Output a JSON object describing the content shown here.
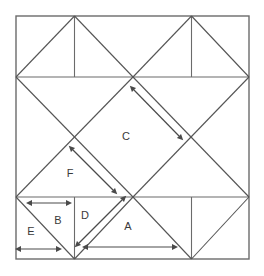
{
  "figure": {
    "type": "geometric-diagram",
    "background_color": "#ffffff",
    "line_color": "#6b6b6b",
    "diagonal_color": "#555555",
    "arrow_color": "#4a4a4a",
    "label_color": "#3a3a3a",
    "canvas": {
      "width": 264,
      "height": 276
    }
  },
  "outer_square": {
    "name": "outer-square",
    "left": 16,
    "top": 16,
    "right": 249,
    "bottom": 259,
    "width": 233,
    "height": 243
  },
  "grid": {
    "x_stops": [
      16,
      74.5,
      133,
      191.5,
      249
    ],
    "y_stops": [
      16,
      77,
      197,
      259
    ],
    "horizontal_lines": [
      {
        "name": "upper-horizontal",
        "y": 77,
        "x1": 16,
        "x2": 249
      },
      {
        "name": "lower-horizontal",
        "y": 197,
        "x1": 16,
        "x2": 249
      }
    ],
    "vertical_lines": [
      {
        "name": "top-band-vertical-left",
        "x": 74.5,
        "y1": 16,
        "y2": 77
      },
      {
        "name": "top-band-vertical-right",
        "x": 191.5,
        "y1": 16,
        "y2": 77
      },
      {
        "name": "bottom-band-vertical-left",
        "x": 74.5,
        "y1": 197,
        "y2": 259
      },
      {
        "name": "bottom-band-vertical-right",
        "x": 191.5,
        "y1": 197,
        "y2": 259
      }
    ]
  },
  "diagonals": [
    {
      "name": "diag-tl-corner-to-center",
      "x1": 16,
      "y1": 77,
      "x2": 74.5,
      "y2": 16
    },
    {
      "name": "diag-top-apex-left-down-right",
      "x1": 74.5,
      "y1": 16,
      "x2": 133,
      "y2": 77
    },
    {
      "name": "diag-center-up-right",
      "x1": 133,
      "y1": 77,
      "x2": 191.5,
      "y2": 16
    },
    {
      "name": "diag-top-apex-right-down-right",
      "x1": 191.5,
      "y1": 16,
      "x2": 249,
      "y2": 77
    },
    {
      "name": "diag-left-mid-to-center-down",
      "x1": 16,
      "y1": 77,
      "x2": 133,
      "y2": 197
    },
    {
      "name": "diag-center-to-right-mid-up",
      "x1": 133,
      "y1": 77,
      "x2": 249,
      "y2": 197
    },
    {
      "name": "diag-center-down-to-left-mid",
      "x1": 133,
      "y1": 77,
      "x2": 16,
      "y2": 197
    },
    {
      "name": "diag-right-mid-up-to-center",
      "x1": 249,
      "y1": 77,
      "x2": 133,
      "y2": 197
    },
    {
      "name": "diag-bottom-left-wedge-left",
      "x1": 16,
      "y1": 197,
      "x2": 74.5,
      "y2": 259
    },
    {
      "name": "diag-bottom-left-wedge-right",
      "x1": 74.5,
      "y1": 259,
      "x2": 133,
      "y2": 197
    },
    {
      "name": "diag-bottom-right-wedge-left",
      "x1": 133,
      "y1": 197,
      "x2": 191.5,
      "y2": 259
    },
    {
      "name": "diag-bottom-right-wedge-right",
      "x1": 191.5,
      "y1": 259,
      "x2": 249,
      "y2": 197
    }
  ],
  "labels": [
    {
      "id": "A",
      "text": "A",
      "x": 128,
      "y": 227,
      "region": "bottom-large-triangle"
    },
    {
      "id": "B",
      "text": "B",
      "x": 58,
      "y": 221,
      "region": "bottom-left-small-triangle"
    },
    {
      "id": "C",
      "text": "C",
      "x": 126,
      "y": 137,
      "region": "central-diamond-upper"
    },
    {
      "id": "D",
      "text": "D",
      "x": 85,
      "y": 216,
      "region": "bottom-narrow-wedge"
    },
    {
      "id": "E",
      "text": "E",
      "x": 31,
      "y": 232,
      "region": "bottom-left-corner-triangle"
    },
    {
      "id": "F",
      "text": "F",
      "x": 70,
      "y": 174,
      "region": "central-diamond-lower-left"
    }
  ],
  "arrows": [
    {
      "id": "arrow-A",
      "name": "measure-arrow-a",
      "label_ref": "A",
      "orientation": "horizontal",
      "x1": 88,
      "y1": 247,
      "x2": 172,
      "y2": 247,
      "double_headed": true
    },
    {
      "id": "arrow-B",
      "name": "measure-arrow-b",
      "label_ref": "B",
      "orientation": "horizontal",
      "x1": 32,
      "y1": 203,
      "x2": 66,
      "y2": 203,
      "double_headed": true
    },
    {
      "id": "arrow-C",
      "name": "measure-arrow-c",
      "label_ref": "C",
      "orientation": "diagonal-down-right",
      "x1": 134,
      "y1": 90,
      "x2": 179,
      "y2": 136,
      "double_headed": true
    },
    {
      "id": "arrow-D",
      "name": "measure-arrow-d",
      "label_ref": "D",
      "orientation": "diagonal-up-right",
      "x1": 79,
      "y1": 243,
      "x2": 122,
      "y2": 200,
      "double_headed": true
    },
    {
      "id": "arrow-E",
      "name": "measure-arrow-e",
      "label_ref": "E",
      "orientation": "horizontal",
      "x1": 21,
      "y1": 249,
      "x2": 56,
      "y2": 249,
      "double_headed": true
    },
    {
      "id": "arrow-F",
      "name": "measure-arrow-f",
      "label_ref": "F",
      "orientation": "diagonal-down-right",
      "x1": 73,
      "y1": 150,
      "x2": 113,
      "y2": 190,
      "double_headed": true
    }
  ]
}
